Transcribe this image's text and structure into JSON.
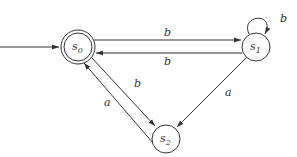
{
  "diagram": {
    "type": "finite-automaton",
    "states": [
      {
        "id": "s0",
        "label": "s",
        "subscript": "0",
        "initial": true,
        "accepting": true
      },
      {
        "id": "s1",
        "label": "s",
        "subscript": "1",
        "initial": false,
        "accepting": false
      },
      {
        "id": "s2",
        "label": "s",
        "subscript": "2",
        "initial": false,
        "accepting": false
      }
    ],
    "transitions": [
      {
        "from": "s0",
        "to": "s1",
        "label": "b"
      },
      {
        "from": "s1",
        "to": "s0",
        "label": "b"
      },
      {
        "from": "s1",
        "to": "s1",
        "label": "b"
      },
      {
        "from": "s0",
        "to": "s2",
        "label": "b"
      },
      {
        "from": "s2",
        "to": "s0",
        "label": "a"
      },
      {
        "from": "s1",
        "to": "s2",
        "label": "a"
      }
    ],
    "colors": {
      "stroke": "#333333",
      "background": "#ffffff"
    }
  }
}
